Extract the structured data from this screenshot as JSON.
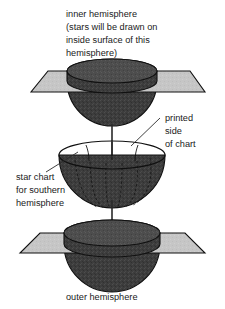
{
  "figure": {
    "background_color": "#ffffff",
    "width": 225,
    "height": 309
  },
  "palette": {
    "hemisphere_fill": "#3d3d3d",
    "hemisphere_fill_light": "#4a4a4a",
    "hemisphere_cap_fill": "#4f4f4f",
    "plane_fill": "#c6c6c6",
    "plane_edge_fill": "#a8a8a8",
    "outline": "#101010",
    "text": "#1a1a1a",
    "leader": "#2b2b2b"
  },
  "labels": {
    "inner_hemisphere": {
      "lines": [
        "inner hemisphere",
        "(stars will be drawn on",
        "inside surface of this",
        "hemisphere)"
      ]
    },
    "printed_side": {
      "lines": [
        "printed",
        "side",
        "of chart"
      ]
    },
    "star_chart": {
      "lines": [
        "star chart",
        "for southern",
        "hemisphere"
      ]
    },
    "outer_hemisphere": {
      "text": "outer hemisphere"
    }
  },
  "parts": {
    "top_assembly": {
      "name": "inner hemisphere with horizon plane",
      "hemisphere_name": "inner-hemisphere-dome",
      "plane_name": "top-horizon-plane"
    },
    "middle_assembly": {
      "name": "southern star chart hemisphere",
      "hemisphere_name": "star-chart-hemisphere",
      "meridian_count": 7
    },
    "bottom_assembly": {
      "name": "outer hemisphere with horizon plane",
      "hemisphere_name": "outer-hemisphere-dome",
      "plane_name": "bottom-horizon-plane"
    },
    "assembly_arrow": {
      "name": "downward assembly arrow",
      "direction": "down"
    }
  }
}
